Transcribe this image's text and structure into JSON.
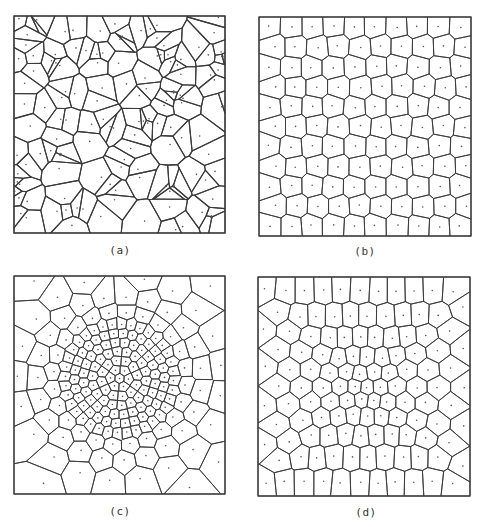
{
  "figure": {
    "background": "#ffffff",
    "line_color": "#3a3a3a",
    "dot_color": "#555555",
    "panels": [
      {
        "id": "a",
        "caption": "(a)",
        "box": {
          "x": 14,
          "y": 16,
          "w": 211,
          "h": 217
        },
        "caption_pos": {
          "x": 120,
          "y": 244
        },
        "pattern": "random",
        "seed": 7,
        "count": 118,
        "line_width": 1.1,
        "description": "Irregular random Voronoi tessellation with clustered small cells"
      },
      {
        "id": "b",
        "caption": "(b)",
        "box": {
          "x": 259,
          "y": 17,
          "w": 212,
          "h": 219
        },
        "caption_pos": {
          "x": 365,
          "y": 245
        },
        "pattern": "hex",
        "seed": 3,
        "rows": 11,
        "cols": 10,
        "jitter": 0.12,
        "line_width": 0.9,
        "description": "Nearly regular hexagonal (centroidal) Voronoi tessellation"
      },
      {
        "id": "c",
        "caption": "(c)",
        "box": {
          "x": 14,
          "y": 276,
          "w": 211,
          "h": 218
        },
        "caption_pos": {
          "x": 120,
          "y": 505
        },
        "pattern": "radial",
        "seed": 11,
        "rings": 10,
        "base": 6,
        "growth": 1.32,
        "center": {
          "x": 0.5,
          "y": 0.47
        },
        "line_width": 0.9,
        "description": "Radially graded Voronoi tessellation, dense at center"
      },
      {
        "id": "d",
        "caption": "(d)",
        "box": {
          "x": 258,
          "y": 277,
          "w": 212,
          "h": 219
        },
        "caption_pos": {
          "x": 366,
          "y": 506
        },
        "pattern": "graded",
        "seed": 5,
        "rows": 11,
        "cols": 11,
        "strength": 0.42,
        "line_width": 0.9,
        "description": "Mildly graded Voronoi tessellation, finer toward center"
      }
    ]
  }
}
